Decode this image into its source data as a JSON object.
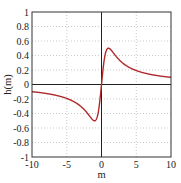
{
  "chart_data": {
    "type": "line",
    "title": "",
    "xlabel": "m",
    "ylabel": "h(m)",
    "xlim": [
      -10,
      10
    ],
    "ylim": [
      -1,
      1
    ],
    "grid": true,
    "legend": null,
    "xticks": [
      "-10",
      "-5",
      "0",
      "5",
      "10"
    ],
    "yticks": [
      "1",
      "0.8",
      "0.6",
      "0.4",
      "0.2",
      "0",
      "-0.2",
      "-0.4",
      "-0.6",
      "-0.8",
      "-1"
    ],
    "series": [
      {
        "name": "h(m)",
        "color": "#b0282a",
        "x": [
          -10,
          -8,
          -6,
          -5,
          -4,
          -3,
          -2,
          -1.5,
          -1,
          -0.8,
          -0.6,
          -0.4,
          -0.2,
          0,
          0.2,
          0.4,
          0.6,
          0.8,
          1,
          1.5,
          2,
          3,
          4,
          5,
          6,
          8,
          10
        ],
        "y": [
          -0.1,
          -0.12,
          -0.16,
          -0.19,
          -0.23,
          -0.3,
          -0.4,
          -0.45,
          -0.5,
          -0.49,
          -0.42,
          -0.3,
          -0.15,
          0,
          0.15,
          0.3,
          0.42,
          0.49,
          0.5,
          0.45,
          0.4,
          0.3,
          0.23,
          0.19,
          0.16,
          0.12,
          0.1
        ]
      }
    ]
  }
}
